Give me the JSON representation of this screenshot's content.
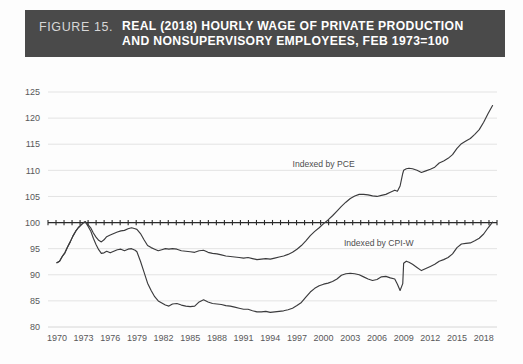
{
  "figure": {
    "label": "FIGURE 15.",
    "title_line_1": "REAL (2018) HOURLY WAGE OF PRIVATE PRODUCTION",
    "title_line_2": "AND NONSUPERVISORY EMPLOYEES, FEB 1973=100",
    "banner_color": "#4a4a4a",
    "label_color": "#d7d7d7",
    "title_color": "#ffffff"
  },
  "chart_data": {
    "type": "line",
    "title": "REAL (2018) HOURLY WAGE OF PRIVATE PRODUCTION AND NONSUPERVISORY EMPLOYEES, FEB 1973=100",
    "xlabel": "",
    "ylabel": "",
    "xlim": [
      1969.0,
      2019.5
    ],
    "ylim": [
      80,
      125
    ],
    "ytick_labels": [
      "80",
      "85",
      "90",
      "95",
      "100",
      "105",
      "110",
      "115",
      "120",
      "125"
    ],
    "yticks": [
      80,
      85,
      90,
      95,
      100,
      105,
      110,
      115,
      120,
      125
    ],
    "xtick_labels": [
      "1970",
      "1973",
      "1976",
      "1979",
      "1982",
      "1985",
      "1988",
      "1991",
      "1994",
      "1997",
      "2000",
      "2003",
      "2006",
      "2009",
      "2012",
      "2015",
      "2018"
    ],
    "xticks": [
      1970,
      1973,
      1976,
      1979,
      1982,
      1985,
      1988,
      1991,
      1994,
      1997,
      2000,
      2003,
      2006,
      2009,
      2012,
      2015,
      2018
    ],
    "grid": true,
    "grid_color": "#e3e3e3",
    "legend": "annotations",
    "reference_line": {
      "value": 100,
      "style": "solid-with-ticks",
      "color": "#2b2b2b"
    },
    "line_color": "#3b3b3d",
    "annotations": [
      {
        "text": "Indexed by PCE",
        "x": 2000.0,
        "y": 110.6
      },
      {
        "text": "Indexed by CPI-W",
        "x": 2006.2,
        "y": 95.6
      }
    ],
    "series": [
      {
        "name": "Indexed by PCE",
        "x": [
          1970.0,
          1970.3,
          1970.6,
          1970.9,
          1971.2,
          1971.5,
          1971.8,
          1972.1,
          1972.4,
          1972.7,
          1973.0,
          1973.2,
          1973.5,
          1973.8,
          1974.1,
          1974.4,
          1974.7,
          1975.0,
          1975.3,
          1975.6,
          1976.0,
          1976.4,
          1976.8,
          1977.2,
          1977.6,
          1978.0,
          1978.4,
          1978.8,
          1979.0,
          1979.4,
          1979.8,
          1980.2,
          1980.6,
          1981.0,
          1981.4,
          1981.8,
          1982.2,
          1982.6,
          1983.0,
          1983.5,
          1984.0,
          1984.5,
          1985.0,
          1985.5,
          1986.0,
          1986.5,
          1987.0,
          1987.5,
          1988.0,
          1988.5,
          1989.0,
          1989.5,
          1990.0,
          1990.5,
          1991.0,
          1991.5,
          1992.0,
          1992.5,
          1993.0,
          1993.5,
          1994.0,
          1994.5,
          1995.0,
          1995.5,
          1996.0,
          1996.5,
          1997.0,
          1997.5,
          1998.0,
          1998.5,
          1999.0,
          1999.5,
          2000.0,
          2000.5,
          2001.0,
          2001.5,
          2002.0,
          2002.5,
          2003.0,
          2003.5,
          2004.0,
          2004.5,
          2005.0,
          2005.5,
          2006.0,
          2006.5,
          2007.0,
          2007.5,
          2008.0,
          2008.3,
          2008.6,
          2008.9,
          2009.0,
          2009.3,
          2009.6,
          2010.0,
          2010.5,
          2011.0,
          2011.5,
          2012.0,
          2012.5,
          2013.0,
          2013.5,
          2014.0,
          2014.5,
          2015.0,
          2015.5,
          2016.0,
          2016.5,
          2017.0,
          2017.5,
          2018.0,
          2018.5,
          2019.0
        ],
        "y": [
          92.3,
          92.6,
          93.5,
          94.2,
          95.3,
          96.3,
          97.4,
          98.3,
          99.0,
          99.5,
          100.0,
          100.2,
          99.6,
          99.0,
          98.0,
          97.2,
          96.6,
          96.3,
          96.7,
          97.3,
          97.6,
          97.9,
          98.2,
          98.4,
          98.5,
          98.8,
          99.0,
          98.8,
          98.7,
          97.9,
          96.7,
          95.6,
          95.2,
          94.9,
          94.6,
          94.8,
          95.0,
          94.9,
          95.0,
          94.9,
          94.6,
          94.5,
          94.4,
          94.3,
          94.6,
          94.7,
          94.3,
          94.1,
          94.0,
          93.8,
          93.6,
          93.5,
          93.4,
          93.3,
          93.2,
          93.3,
          93.1,
          92.9,
          93.0,
          93.1,
          93.0,
          93.2,
          93.4,
          93.6,
          93.9,
          94.3,
          94.9,
          95.6,
          96.5,
          97.5,
          98.3,
          99.0,
          99.8,
          100.5,
          101.3,
          102.2,
          103.1,
          103.9,
          104.6,
          105.1,
          105.4,
          105.4,
          105.3,
          105.1,
          105.0,
          105.2,
          105.4,
          105.8,
          106.2,
          106.0,
          107.0,
          109.4,
          110.0,
          110.3,
          110.4,
          110.3,
          110.0,
          109.6,
          109.9,
          110.2,
          110.6,
          111.4,
          111.8,
          112.3,
          113.0,
          114.2,
          115.1,
          115.6,
          116.1,
          116.9,
          117.8,
          119.2,
          120.9,
          122.4
        ]
      },
      {
        "name": "Indexed by CPI-W",
        "x": [
          1970.0,
          1970.3,
          1970.6,
          1970.9,
          1971.2,
          1971.5,
          1971.8,
          1972.1,
          1972.4,
          1972.7,
          1973.0,
          1973.2,
          1973.5,
          1973.8,
          1974.1,
          1974.4,
          1974.7,
          1975.0,
          1975.3,
          1975.6,
          1976.0,
          1976.4,
          1976.8,
          1977.2,
          1977.6,
          1978.0,
          1978.4,
          1978.8,
          1979.0,
          1979.4,
          1979.8,
          1980.2,
          1980.6,
          1981.0,
          1981.4,
          1981.8,
          1982.2,
          1982.6,
          1983.0,
          1983.5,
          1984.0,
          1984.5,
          1985.0,
          1985.5,
          1986.0,
          1986.5,
          1987.0,
          1987.5,
          1988.0,
          1988.5,
          1989.0,
          1989.5,
          1990.0,
          1990.5,
          1991.0,
          1991.5,
          1992.0,
          1992.5,
          1993.0,
          1993.5,
          1994.0,
          1994.5,
          1995.0,
          1995.5,
          1996.0,
          1996.5,
          1997.0,
          1997.5,
          1998.0,
          1998.5,
          1999.0,
          1999.5,
          2000.0,
          2000.5,
          2001.0,
          2001.5,
          2002.0,
          2002.5,
          2003.0,
          2003.5,
          2004.0,
          2004.5,
          2005.0,
          2005.5,
          2006.0,
          2006.5,
          2007.0,
          2007.5,
          2008.0,
          2008.3,
          2008.6,
          2008.9,
          2009.0,
          2009.3,
          2009.6,
          2010.0,
          2010.5,
          2011.0,
          2011.5,
          2012.0,
          2012.5,
          2013.0,
          2013.5,
          2014.0,
          2014.5,
          2015.0,
          2015.5,
          2016.0,
          2016.5,
          2017.0,
          2017.5,
          2018.0,
          2018.5,
          2019.0
        ],
        "y": [
          92.3,
          92.6,
          93.5,
          94.2,
          95.3,
          96.3,
          97.4,
          98.3,
          99.0,
          99.5,
          100.0,
          100.1,
          99.3,
          98.4,
          97.0,
          95.8,
          94.8,
          94.1,
          94.2,
          94.5,
          94.2,
          94.5,
          94.8,
          94.9,
          94.6,
          94.9,
          95.0,
          94.7,
          94.4,
          92.6,
          90.5,
          88.4,
          87.0,
          85.8,
          85.0,
          84.6,
          84.2,
          84.0,
          84.4,
          84.5,
          84.2,
          84.0,
          83.9,
          84.0,
          84.8,
          85.2,
          84.8,
          84.5,
          84.4,
          84.3,
          84.1,
          84.0,
          83.8,
          83.6,
          83.4,
          83.4,
          83.1,
          82.9,
          82.9,
          83.0,
          82.8,
          82.9,
          83.0,
          83.1,
          83.3,
          83.6,
          84.1,
          84.7,
          85.7,
          86.7,
          87.4,
          87.9,
          88.2,
          88.4,
          88.7,
          89.2,
          89.9,
          90.2,
          90.3,
          90.2,
          90.0,
          89.6,
          89.2,
          88.9,
          89.1,
          89.6,
          89.7,
          89.4,
          89.2,
          88.2,
          87.0,
          88.3,
          92.2,
          92.6,
          92.4,
          92.0,
          91.4,
          90.8,
          91.2,
          91.6,
          92.0,
          92.6,
          92.9,
          93.3,
          94.0,
          95.2,
          95.9,
          96.0,
          96.1,
          96.5,
          97.0,
          97.8,
          99.0,
          100.1
        ]
      }
    ]
  }
}
